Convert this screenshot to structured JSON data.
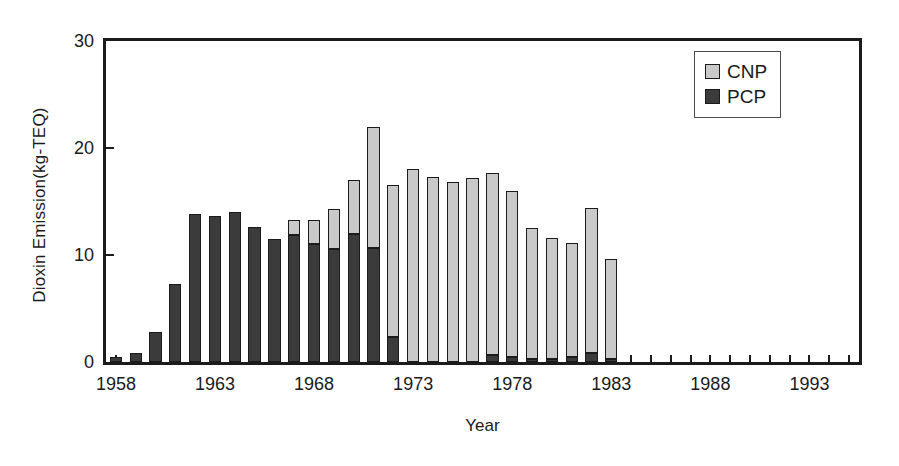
{
  "chart_data": {
    "type": "bar",
    "stacked": true,
    "title": "",
    "subtitle": "",
    "xlabel": "Year",
    "ylabel": "Dioxin Emission(kg-TEQ)",
    "ylim": [
      0,
      30
    ],
    "yticks": [
      0,
      10,
      20,
      30
    ],
    "ytick_labels": [
      "0",
      "10",
      "20",
      "30"
    ],
    "xlim": [
      1957.5,
      1995.5
    ],
    "xticks": [
      1958,
      1963,
      1968,
      1973,
      1978,
      1983,
      1988,
      1993
    ],
    "xtick_labels": [
      "1958",
      "1963",
      "1968",
      "1973",
      "1978",
      "1983",
      "1988",
      "1993"
    ],
    "grid": false,
    "legend_position": "top-right",
    "legend": [
      "CNP",
      "PCP"
    ],
    "categories": [
      1958,
      1959,
      1960,
      1961,
      1962,
      1963,
      1964,
      1965,
      1966,
      1967,
      1968,
      1969,
      1970,
      1971,
      1972,
      1973,
      1974,
      1975,
      1976,
      1977,
      1978,
      1979,
      1980,
      1981,
      1982,
      1983,
      1984,
      1985,
      1986,
      1987,
      1988,
      1989,
      1990,
      1991,
      1992,
      1993,
      1994,
      1995
    ],
    "series": [
      {
        "name": "PCP",
        "color": "#3b3b3b",
        "values": [
          0.5,
          0.8,
          2.8,
          7.3,
          13.8,
          13.6,
          14.0,
          12.6,
          11.5,
          11.9,
          11.0,
          10.6,
          12.0,
          10.7,
          2.3,
          0.0,
          0.0,
          0.0,
          0.0,
          0.7,
          0.5,
          0.3,
          0.3,
          0.5,
          0.8,
          0.3,
          0.0,
          0.0,
          0.0,
          0.0,
          0.0,
          0.0,
          0.0,
          0.0,
          0.0,
          0.0,
          0.0,
          0.0
        ]
      },
      {
        "name": "CNP",
        "color": "#c9c9c9",
        "values": [
          0.0,
          0.0,
          0.0,
          0.0,
          0.0,
          0.0,
          0.0,
          0.0,
          0.0,
          1.4,
          2.3,
          3.7,
          5.0,
          11.3,
          14.2,
          18.0,
          17.3,
          16.8,
          17.2,
          17.0,
          15.5,
          12.2,
          11.3,
          10.6,
          13.6,
          9.3,
          0.0,
          0.0,
          0.0,
          0.0,
          0.0,
          0.0,
          0.0,
          0.0,
          0.0,
          0.0,
          0.0,
          0.0
        ]
      }
    ],
    "totals": [
      0.5,
      0.8,
      2.8,
      7.3,
      13.8,
      13.6,
      14.0,
      12.6,
      11.5,
      13.3,
      13.3,
      14.3,
      17.0,
      22.0,
      16.5,
      18.0,
      17.3,
      16.8,
      17.2,
      17.7,
      16.0,
      12.5,
      11.6,
      11.1,
      14.4,
      9.6,
      0.0,
      0.0,
      0.0,
      0.0,
      0.0,
      0.0,
      0.0,
      0.0,
      0.0,
      0.0,
      0.0,
      0.0
    ]
  }
}
